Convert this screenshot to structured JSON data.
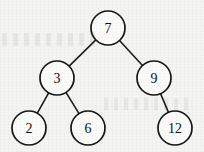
{
  "figure": {
    "kind": "binary-search-tree-diagram",
    "width": 204,
    "height": 152,
    "background_color": "#f4f4f3",
    "stroke_color": "#161616",
    "node_fill_color": "#fbfbfa",
    "label_color": "#101010"
  },
  "chart_data": {
    "type": "diagram",
    "title": "",
    "xlabel": "",
    "ylabel": "",
    "node_radius": 17,
    "nodes": [
      {
        "id": "n7",
        "label": "7",
        "x": 108,
        "y": 28,
        "depth": 0,
        "role": "root"
      },
      {
        "id": "n3",
        "label": "3",
        "x": 57,
        "y": 78,
        "depth": 1,
        "role": "left-child"
      },
      {
        "id": "n9",
        "label": "9",
        "x": 154,
        "y": 78,
        "depth": 1,
        "role": "right-child"
      },
      {
        "id": "n2",
        "label": "2",
        "x": 29,
        "y": 128,
        "depth": 2,
        "role": "leaf"
      },
      {
        "id": "n6",
        "label": "6",
        "x": 88,
        "y": 128,
        "depth": 2,
        "role": "leaf"
      },
      {
        "id": "n12",
        "label": "12",
        "x": 175,
        "y": 128,
        "depth": 2,
        "role": "leaf"
      }
    ],
    "edges": [
      {
        "from": "n7",
        "to": "n3",
        "side": "left"
      },
      {
        "from": "n7",
        "to": "n9",
        "side": "right"
      },
      {
        "from": "n3",
        "to": "n2",
        "side": "left"
      },
      {
        "from": "n3",
        "to": "n6",
        "side": "right"
      },
      {
        "from": "n9",
        "to": "n12",
        "side": "right"
      }
    ]
  }
}
